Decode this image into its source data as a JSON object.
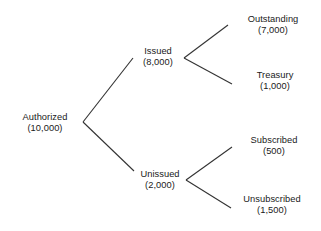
{
  "diagram": {
    "type": "tree",
    "background_color": "#ffffff",
    "line_color": "#333333",
    "text_color": "#1a1a1a",
    "nodes": [
      {
        "id": "authorized",
        "label": "Authorized",
        "value": "(10,000)",
        "amount": 10000,
        "level": 0,
        "x": 45,
        "y": 123
      },
      {
        "id": "issued",
        "label": "Issued",
        "value": "(8,000)",
        "amount": 8000,
        "level": 1,
        "x": 158,
        "y": 57
      },
      {
        "id": "unissued",
        "label": "Unissued",
        "value": "(2,000)",
        "amount": 2000,
        "level": 1,
        "x": 160,
        "y": 180
      },
      {
        "id": "outstanding",
        "label": "Outstanding",
        "value": "(7,000)",
        "amount": 7000,
        "level": 2,
        "x": 273,
        "y": 25
      },
      {
        "id": "treasury",
        "label": "Treasury",
        "value": "(1,000)",
        "amount": 1000,
        "level": 2,
        "x": 275,
        "y": 81
      },
      {
        "id": "subscribed",
        "label": "Subscribed",
        "value": "(500)",
        "amount": 500,
        "level": 2,
        "x": 274,
        "y": 146
      },
      {
        "id": "unsubscribed",
        "label": "Unsubscribed",
        "value": "(1,500)",
        "amount": 1500,
        "level": 2,
        "x": 272,
        "y": 205
      }
    ],
    "edges": [
      {
        "id": "authorized-issued",
        "from": "authorized",
        "to": "issued",
        "x1": 83,
        "y1": 122,
        "x2": 133,
        "y2": 58
      },
      {
        "id": "authorized-unissued",
        "from": "authorized",
        "to": "unissued",
        "x1": 83,
        "y1": 122,
        "x2": 134,
        "y2": 171
      },
      {
        "id": "issued-outstanding",
        "from": "issued",
        "to": "outstanding",
        "x1": 184,
        "y1": 58,
        "x2": 228,
        "y2": 25
      },
      {
        "id": "issued-treasury",
        "from": "issued",
        "to": "treasury",
        "x1": 184,
        "y1": 58,
        "x2": 232,
        "y2": 84
      },
      {
        "id": "unissued-subscribed",
        "from": "unissued",
        "to": "subscribed",
        "x1": 186,
        "y1": 180,
        "x2": 232,
        "y2": 147
      },
      {
        "id": "unissued-unsubscribed",
        "from": "unissued",
        "to": "unsubscribed",
        "x1": 186,
        "y1": 180,
        "x2": 231,
        "y2": 208
      }
    ]
  }
}
